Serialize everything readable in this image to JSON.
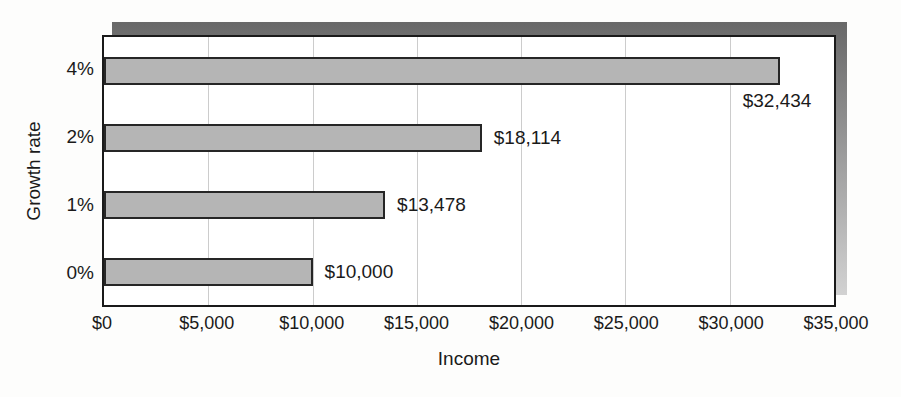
{
  "chart_data": {
    "type": "bar",
    "orientation": "horizontal",
    "xlabel": "Income",
    "ylabel": "Growth rate",
    "categories": [
      "4%",
      "2%",
      "1%",
      "0%"
    ],
    "values": [
      32434,
      18114,
      13478,
      10000
    ],
    "value_labels": [
      "$32,434",
      "$18,114",
      "$13,478",
      "$10,000"
    ],
    "value_label_placement": [
      "below-end",
      "right",
      "right",
      "right"
    ],
    "xlim": [
      0,
      35000
    ],
    "x_ticks": [
      0,
      5000,
      10000,
      15000,
      20000,
      25000,
      30000,
      35000
    ],
    "x_tick_labels": [
      "$0",
      "$5,000",
      "$10,000",
      "$15,000",
      "$20,000",
      "$25,000",
      "$30,000",
      "$35,000"
    ],
    "grid": "vertical",
    "legend": "none",
    "colors": {
      "bar_fill": "#b5b5b5",
      "bar_border": "#262626",
      "plot_border": "#1a1a1a",
      "gridline": "#cccccc",
      "shadow_top": "#686868",
      "shadow_bottom": "#d2d2d2",
      "plot_background": "#ffffff",
      "text": "#1a1a1a"
    }
  }
}
